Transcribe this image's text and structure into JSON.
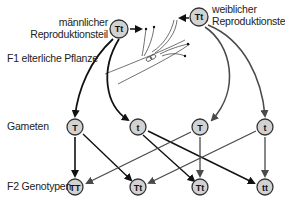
{
  "labels": {
    "male": [
      "männlicher",
      "Reproduktionsteil"
    ],
    "female": [
      "weiblicher",
      "Reproduktionsteil"
    ],
    "f1": "F1 elterliche Pflanze",
    "gametes": "Gameten",
    "f2": "F2 Genotypen"
  },
  "parents": {
    "male": {
      "genotype": "Tt",
      "x": 119,
      "y": 29
    },
    "female": {
      "genotype": "Tt",
      "x": 199,
      "y": 17
    }
  },
  "gametes": [
    {
      "allele": "T",
      "x": 75,
      "y": 127,
      "source": "male"
    },
    {
      "allele": "t",
      "x": 138,
      "y": 127,
      "source": "male"
    },
    {
      "allele": "T",
      "x": 200,
      "y": 127,
      "source": "female"
    },
    {
      "allele": "t",
      "x": 265,
      "y": 127,
      "source": "female"
    }
  ],
  "f2_genotypes": [
    {
      "genotype": "TT",
      "x": 75,
      "y": 187
    },
    {
      "genotype": "Tt",
      "x": 138,
      "y": 187
    },
    {
      "genotype": "Tt",
      "x": 200,
      "y": 187
    },
    {
      "genotype": "tt",
      "x": 265,
      "y": 187
    }
  ],
  "colors": {
    "circle_fill": "#d2d2d2",
    "circle_stroke": "#333333",
    "male_arrow": "#111111",
    "female_arrow": "#4a4a4a",
    "text": "#222222"
  }
}
